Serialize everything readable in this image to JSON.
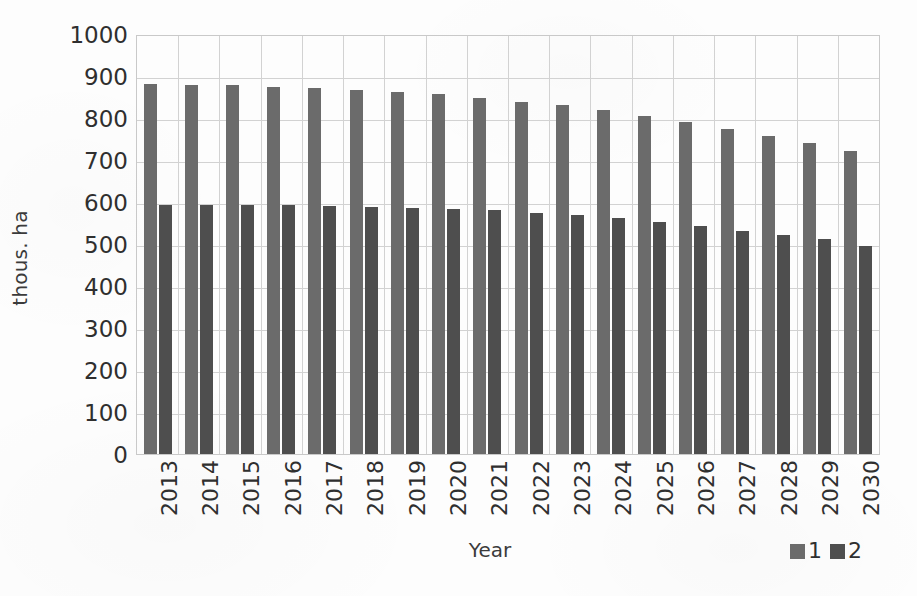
{
  "chart_data": {
    "type": "bar",
    "title": "",
    "xlabel": "Year",
    "ylabel": "thous. ha",
    "ylim": [
      0,
      1000
    ],
    "yticks": [
      0,
      100,
      200,
      300,
      400,
      500,
      600,
      700,
      800,
      900,
      1000
    ],
    "grid": true,
    "legend_position": "bottom-right",
    "categories": [
      "2013",
      "2014",
      "2015",
      "2016",
      "2017",
      "2018",
      "2019",
      "2020",
      "2021",
      "2022",
      "2023",
      "2024",
      "2025",
      "2026",
      "2027",
      "2028",
      "2029",
      "2030"
    ],
    "series": [
      {
        "name": "1",
        "color": "#6b6b6b",
        "values": [
          880,
          879,
          878,
          875,
          872,
          866,
          861,
          856,
          848,
          838,
          830,
          819,
          805,
          790,
          775,
          757,
          741,
          722
        ]
      },
      {
        "name": "2",
        "color": "#4e4e4e",
        "values": [
          592,
          592,
          592,
          592,
          590,
          588,
          586,
          584,
          581,
          575,
          568,
          561,
          553,
          544,
          531,
          522,
          511,
          495
        ]
      }
    ]
  },
  "legend": {
    "items": [
      {
        "label": "1",
        "color": "#6b6b6b"
      },
      {
        "label": "2",
        "color": "#4e4e4e"
      }
    ]
  },
  "axes": {
    "y_title": "thous. ha",
    "x_title": "Year"
  },
  "colors": {
    "series_1": "#6b6b6b",
    "series_2": "#4e4e4e",
    "gridline": "#d2d2d2",
    "border": "#c9c9c9",
    "text": "#2f2f2f",
    "background": "#fdfdfd"
  }
}
